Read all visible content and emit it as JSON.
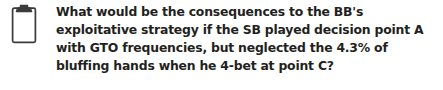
{
  "callout": {
    "icon_name": "clipboard-icon",
    "icon_color": "#3b3b3b",
    "text_color": "#231f20",
    "background_color": "#ffffff",
    "question": "What would be the consequences to the BB's exploitative strategy if the SB played decision point A with GTO frequencies, but neglected the 4.3% of bluffing hands when he 4-bet at point C?",
    "lines": [
      "What would be the consequences to the BB's exploitative",
      "strategy if the SB played decision point A with GTO frequen-",
      "cies, but neglected the 4.3% of bluffing hands when he 4-bet",
      "at point C?"
    ]
  }
}
